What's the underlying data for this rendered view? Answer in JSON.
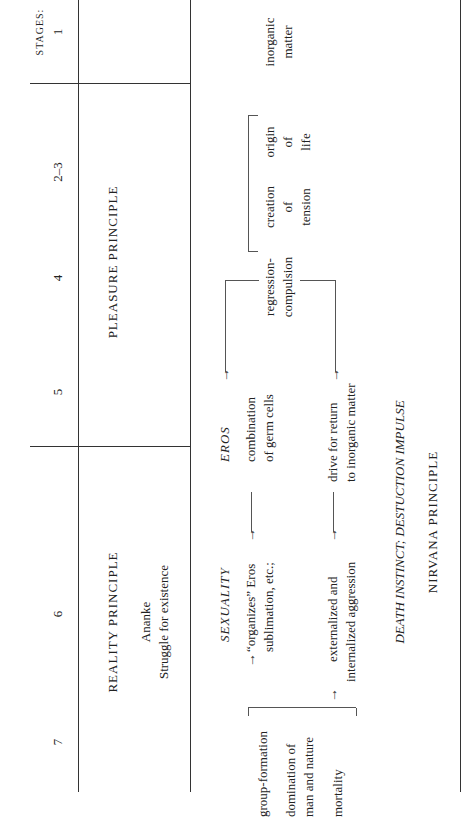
{
  "diagram": {
    "stages_label": "STAGES:",
    "stages": [
      "1",
      "2–3",
      "4",
      "5",
      "6",
      "7"
    ],
    "principles": {
      "pleasure": "PLEASURE PRINCIPLE",
      "reality": "REALITY PRINCIPLE",
      "ananke": "Ananke",
      "struggle": "Struggle for existence"
    },
    "stage1": {
      "line1": "inorganic",
      "line2": "matter"
    },
    "stage23": {
      "origin": [
        "origin",
        "of",
        "life"
      ],
      "creation": [
        "creation",
        "of",
        "tension"
      ]
    },
    "stage4": {
      "line1": "regression-",
      "line2": "compulsion"
    },
    "upper_branch": {
      "eros": "EROS",
      "combination_1": "combination",
      "combination_2": "of germ cells",
      "sexuality": "SEXUALITY",
      "organizes_1": "“organizes” Eros",
      "organizes_2": "sublimation, etc.;"
    },
    "lower_branch": {
      "drive_1": "drive for return",
      "drive_2": "to inorganic matter",
      "externalized_1": "externalized and",
      "externalized_2": "internalized aggression"
    },
    "outcomes": {
      "group": "group-formation",
      "domination_1": "domination of",
      "domination_2": "man and nature",
      "mortality": "mortality"
    },
    "death_instinct": "DEATH INSTINCT; DESTUCTION IMPULSE",
    "nirvana": "NIRVANA PRINCIPLE",
    "arrows": {
      "right": "→",
      "up": "↑"
    }
  }
}
